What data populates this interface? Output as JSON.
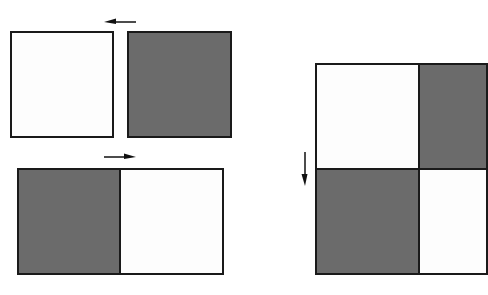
{
  "diagram": {
    "colors": {
      "light": "#fdfdfd",
      "dark": "#6b6b6b",
      "outline": "#1a1a1a"
    },
    "panels": [
      {
        "name": "top-pair",
        "tiles": [
          "light",
          "dark"
        ],
        "arrow": "left"
      },
      {
        "name": "bottom-pair",
        "tiles": [
          "dark",
          "light"
        ],
        "arrow": "right"
      },
      {
        "name": "combined-grid",
        "tiles": [
          [
            "light",
            "dark"
          ],
          [
            "dark",
            "light"
          ]
        ],
        "arrow": "down"
      }
    ]
  }
}
